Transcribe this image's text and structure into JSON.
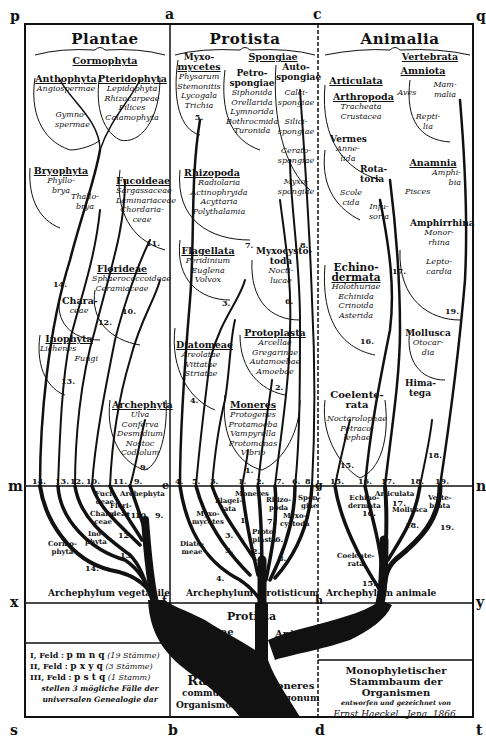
{
  "corners": {
    "p": "p",
    "a": "a",
    "c": "c",
    "q": "q",
    "m": "m",
    "n": "n",
    "x": "x",
    "y": "y",
    "s": "s",
    "b": "b",
    "d": "d",
    "t": "t",
    "e": "e",
    "f": "f",
    "g": "g",
    "h": "h"
  },
  "kingdoms": {
    "plantae": "Plantae",
    "protista": "Protista",
    "animalia": "Animalia"
  },
  "plantae": {
    "cormophyta": "Cormophyta",
    "anthophyta": {
      "head": "Anthophyta",
      "subs": [
        "Angiospermae"
      ]
    },
    "gymnospermae": [
      "Gymno-",
      "spermae"
    ],
    "pteridophyta": {
      "head": "Pteridophyta",
      "subs": [
        "Lepidophyta",
        "Rhizocarpeae",
        "Filices",
        "Calamophyta"
      ]
    },
    "bryophyta": {
      "head": "Bryophyta",
      "subs": [
        "Phyllo-",
        "brya"
      ]
    },
    "thallobrya": [
      "Thallo-",
      "brya"
    ],
    "fucoideae": {
      "head": "Fucoideae",
      "subs": [
        "Sargassaceae",
        "Laminariaceae",
        "Chordaria-",
        "ceae"
      ],
      "num": "11."
    },
    "florideae": {
      "head": "Florideae",
      "subs": [
        "Sphaerococcoideae",
        "Ceramiaceae"
      ],
      "num": "10."
    },
    "characeae": {
      "head": "Chara-",
      "subs": [
        "ceae"
      ],
      "num": "12."
    },
    "inophyta": {
      "head": "Inophyta",
      "subs": [
        "Lichenes",
        "Fungi"
      ],
      "num": "13."
    },
    "archephyta": {
      "head": "Archephyta",
      "subs": [
        "Ulva",
        "Conferva",
        "Desmidium",
        "Nostoc",
        "Codiolum"
      ],
      "num": "9."
    },
    "num14": "14."
  },
  "protista": {
    "myxomycetes": {
      "head": "Myxo-",
      "head2": "mycetes",
      "subs": [
        "Physarum",
        "Stemonitis",
        "Lycogala",
        "Trichia"
      ],
      "num": "5."
    },
    "spongiae": "Spongiae",
    "petrospongiae": {
      "head": "Petro-",
      "head2": "spongiae",
      "subs": [
        "Siphonida",
        "Orellarida",
        "Lymnorida",
        "Bothrocmida",
        "Turonida"
      ]
    },
    "autospongiae": {
      "head": "Auto-",
      "head2": "spongiae",
      "subs": [
        "Calci-",
        "spongiae",
        "Silici-",
        "spongiae",
        "Cerato-",
        "spongiae",
        "Myxo-",
        "spongiae"
      ]
    },
    "rhizopoda": {
      "head": "Rhizopoda",
      "subs": [
        "Radiolaria",
        "Actinophryida",
        "Acyttaria",
        "Polythalamia"
      ],
      "num": "7."
    },
    "flagellata": {
      "head": "Flagellata",
      "subs": [
        "Peridinium",
        "Euglena",
        "Volvox"
      ],
      "num": "3."
    },
    "myxocystoda": {
      "head": "Myxocysto-",
      "head2": "toda",
      "subs": [
        "Nocti-",
        "lucae"
      ],
      "num": "6."
    },
    "num8": "8.",
    "diatomeae": {
      "head": "Diatomeae",
      "subs": [
        "Areolatae",
        "Vittatae",
        "Striatae"
      ],
      "num": "4."
    },
    "protoplasta": {
      "head": "Protoplasta",
      "subs": [
        "Arcellae",
        "Gregarinae",
        "Autamoebae",
        "Amoebae"
      ],
      "num": "2."
    },
    "moneres": {
      "head": "Moneres",
      "subs": [
        "Protogenes",
        "Protamoeba",
        "Vampyrella",
        "Protomonas",
        "Vibrio"
      ],
      "num": "1."
    }
  },
  "animalia": {
    "vertebrata": "Vertebrata",
    "amniota": "Amniota",
    "aves": "Aves",
    "mammalia": [
      "Mam-",
      "malia"
    ],
    "reptilia": [
      "Repti-",
      "lia"
    ],
    "articulata": "Articulata",
    "arthropoda": {
      "head": "Arthropoda",
      "subs": [
        "Tracheata",
        "Crustacea"
      ]
    },
    "vermes": {
      "head": "Vermes",
      "subs": [
        "Anne-",
        "lida"
      ]
    },
    "rotatoria": [
      "Rota-",
      "toria"
    ],
    "scolecida": [
      "Scole",
      "cida"
    ],
    "infusoria": [
      "Infu-",
      "soria"
    ],
    "anamnia": {
      "head": "Anamnia",
      "subs": [
        "Amphi-",
        "bia",
        "Pisces"
      ]
    },
    "amphirrhina": {
      "head": "Amphirrhina",
      "subs": [
        "Monor-",
        "rhina",
        "Lepto-",
        "cardia"
      ],
      "num": "19."
    },
    "num17": "17.",
    "echinodermata": {
      "head": "Echino-",
      "head2": "dermata",
      "subs": [
        "Holothuriae",
        "Echinida",
        "Crinoida",
        "Asterida"
      ],
      "num": "16."
    },
    "mollusca": {
      "head": "Mollusca",
      "subs": [
        "Otocar-",
        "dia"
      ]
    },
    "himatega": [
      "Hima-",
      "tega"
    ],
    "num18": "18.",
    "coelenterata": {
      "head": "Coelente-",
      "head2": "rata",
      "subs": [
        "Noctarolophae",
        "Petraco-",
        "lephae"
      ],
      "num": "15."
    }
  },
  "baseline_numbers": [
    "14.",
    "13.",
    "12.",
    "10.",
    "11.",
    "9.",
    "4.",
    "5.",
    "3.",
    "1.",
    "2.",
    "7.",
    "6.",
    "8.",
    "15.",
    "16.",
    "17.",
    "18.",
    "19."
  ],
  "lower_tree": {
    "plantae_labels": [
      "Fuci-",
      "deae",
      "Archephyta",
      "Flori-",
      "deae",
      "Chara-",
      "ceae",
      "Ino-",
      "phyta",
      "Cormo-",
      "phyta"
    ],
    "plantae_nums": [
      "11.",
      "10.",
      "9.",
      "12.",
      "13.",
      "14."
    ],
    "protista_labels": [
      "Moneres",
      "Flagel-",
      "lata",
      "Myxo-",
      "mycetes",
      "Diato-",
      "meae",
      "Rhizo-",
      "poda",
      "Spon-",
      "giae",
      "Myxo-",
      "cystoda",
      "Proto-",
      "plasta"
    ],
    "protista_nums": [
      "1.",
      "3.",
      "5.",
      "4.",
      "7.",
      "6.",
      "8.",
      "2."
    ],
    "animalia_labels": [
      "Echino-",
      "dermata",
      "Articulata",
      "Mollusca",
      "Verte-",
      "brata",
      "Coelente-",
      "rata"
    ],
    "animalia_nums": [
      "16.",
      "17.",
      "18.",
      "19.",
      "15."
    ]
  },
  "archephyla": {
    "vegetabile": "Archephylum vegetabile",
    "protisticum_1": "Archephylum",
    "protisticum_2": "protisticum",
    "animale_1": "Archephylum",
    "animale_2": "animale"
  },
  "trunk_labels": {
    "protista": "Protista",
    "plantae": "Plantae",
    "animalia": "Animalia"
  },
  "root": {
    "line1": "Radix",
    "line2": "communis",
    "line3": "Organismorum",
    "moneres1": "Moneres",
    "moneres2": "autogonum"
  },
  "legend": {
    "rows": [
      {
        "feld": "I, Feld :",
        "letters": "p m n q",
        "note": "(19 Stämme)"
      },
      {
        "feld": "II, Feld :",
        "letters": "p x y q",
        "note": "(3 Stämme)"
      },
      {
        "feld": "III, Feld :",
        "letters": "p s t q",
        "note": "(1 Stamm)"
      }
    ],
    "caption1": "stellen 3 mögliche Fälle der",
    "caption2": "universalen Genealogie dar"
  },
  "title": {
    "line1": "Monophyletischer",
    "line2": "Stammbaum der Organismen",
    "line3": "entworfen und gezeichnet von",
    "line4": "Ernst Haeckel . Jena, 1866."
  }
}
